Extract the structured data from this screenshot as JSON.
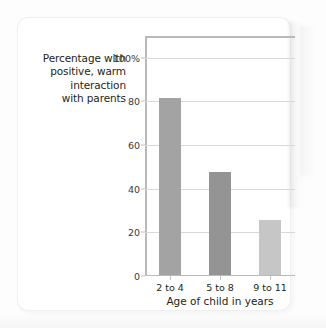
{
  "chart_data": {
    "type": "bar",
    "title": "",
    "categories": [
      "2 to 4",
      "5 to 8",
      "9 to 11"
    ],
    "values": [
      81,
      47,
      25
    ],
    "series": [
      {
        "name": "Percentage with positive, warm interaction with parents",
        "values": [
          81,
          47,
          25
        ]
      }
    ],
    "xlabel": "Age of child in years",
    "ylabel": "Percentage with positive, warm interaction with parents",
    "ylim": [
      0,
      110
    ],
    "yticks": [
      0,
      20,
      40,
      60,
      80,
      100
    ],
    "ytick_labels": [
      "0",
      "20",
      "40",
      "60",
      "80",
      "100%"
    ],
    "grid": true,
    "legend": "none",
    "bar_colors": [
      "#a3a3a3",
      "#949494",
      "#c6c6c6"
    ]
  },
  "axis": {
    "y_caption_lines": [
      "Percentage with",
      "positive, warm",
      "interaction",
      "with parents"
    ],
    "x_title": "Age of child in years"
  },
  "colors": {
    "page_background": "#fdfdfd",
    "card_background": "#ffffff",
    "axis_line": "#b9b9b9",
    "gridline": "#d8d8d8",
    "text": "#231f20"
  }
}
